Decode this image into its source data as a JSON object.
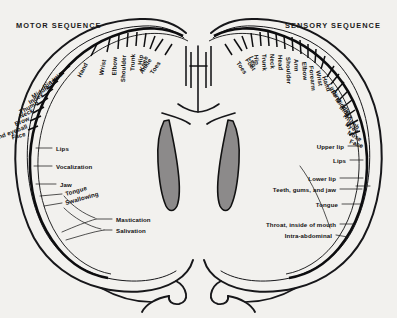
{
  "figure": {
    "background_color": "#f2f1ee",
    "ink_color": "#17171a",
    "ventricle_fill": "#8c8a8a",
    "headers": {
      "left": "MOTOR SEQUENCE",
      "right": "SENSORY SEQUENCE"
    }
  },
  "motor": {
    "title": "MOTOR SEQUENCE",
    "radial_labels": [
      "Toes",
      "Ankle",
      "Knee",
      "Hip",
      "Trunk",
      "Shoulder",
      "Elbow",
      "Wrist",
      "Hand",
      "Little",
      "Ring",
      "Middle",
      "Index",
      "Thumb",
      "Neck",
      "Brow",
      "Eyelid and eyeball",
      "Face"
    ],
    "horizontal_labels": [
      "Lips",
      "Vocalization",
      "Jaw",
      "Tongue",
      "Swallowing"
    ],
    "callout_labels": [
      "Mastication",
      "Salivation"
    ]
  },
  "sensory": {
    "title": "SENSORY SEQUENCE",
    "radial_labels": [
      "Toes",
      "Foot",
      "Leg",
      "Hip",
      "Trunk",
      "Neck",
      "Head",
      "Shoulder",
      "Arm",
      "Elbow",
      "Forearm",
      "Wrist",
      "Hand",
      "Little",
      "Ring",
      "Middle",
      "Index",
      "Thumb",
      "Eyes",
      "Nose",
      "Face"
    ],
    "horizontal_labels": [
      "Upper lip",
      "Lips",
      "Lower lip",
      "Teeth, gums, and jaw",
      "Tongue",
      "Throat, inside of mouth",
      "Intra-abdominal"
    ]
  }
}
